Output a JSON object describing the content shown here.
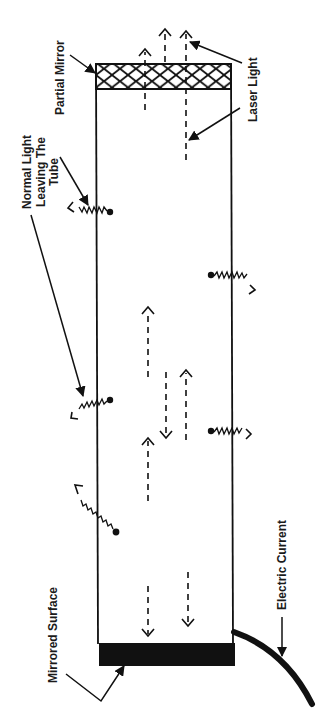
{
  "diagram": {
    "labels": {
      "partial_mirror": "Partial Mirror",
      "laser_light": "Laser Light",
      "normal_light": [
        "Normal Light",
        "Leaving The",
        "Tube"
      ],
      "mirrored_surface": "Mirrored Surface",
      "electric_current": "Electric Current"
    },
    "components": {
      "tube": {
        "x": 96,
        "y": 64,
        "width": 136,
        "height": 580
      },
      "partial_mirror": {
        "x": 96,
        "y": 64,
        "width": 136,
        "height": 25,
        "pattern": "crosshatch"
      },
      "mirrored_surface": {
        "x": 99,
        "y": 643,
        "width": 136,
        "height": 23,
        "fill": "#111111"
      },
      "electric_cable": {
        "from": [
          234,
          632
        ],
        "to": [
          312,
          704
        ]
      }
    },
    "laser_beams_up": [
      {
        "x": 145,
        "y_start": 89,
        "y_end": 48
      },
      {
        "x": 165,
        "y_start": 60,
        "y_end": 28
      },
      {
        "x": 186,
        "y_start": 160,
        "y_end": 31
      }
    ],
    "internal_photons": [
      {
        "x": 148,
        "y1": 377,
        "y2": 308,
        "dir": "up"
      },
      {
        "x": 166,
        "y1": 372,
        "y2": 438,
        "dir": "down"
      },
      {
        "x": 186,
        "y1": 440,
        "y2": 371,
        "dir": "up"
      },
      {
        "x": 148,
        "y1": 501,
        "y2": 438,
        "dir": "up"
      },
      {
        "x": 148,
        "y1": 586,
        "y2": 636,
        "dir": "down"
      },
      {
        "x": 188,
        "y1": 572,
        "y2": 626,
        "dir": "down"
      }
    ],
    "emissions": [
      {
        "atom": [
          110,
          212
        ],
        "tip": [
          68,
          208
        ],
        "side": "left"
      },
      {
        "atom": [
          110,
          400
        ],
        "tip": [
          72,
          417
        ],
        "side": "left"
      },
      {
        "atom": [
          116,
          532
        ],
        "tip": [
          77,
          485
        ],
        "side": "left"
      },
      {
        "atom": [
          211,
          275
        ],
        "tip": [
          255,
          290
        ],
        "side": "right"
      },
      {
        "atom": [
          211,
          431
        ],
        "tip": [
          251,
          434
        ],
        "side": "right"
      }
    ],
    "colors": {
      "ink": "#111111",
      "background": "#ffffff"
    }
  }
}
